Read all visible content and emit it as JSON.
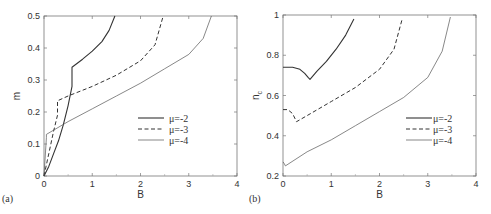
{
  "chart_data": [
    {
      "type": "line",
      "panel_label": "(a)",
      "title": "",
      "xlabel": "B",
      "ylabel": "m",
      "xlim": [
        0,
        4
      ],
      "ylim": [
        0,
        0.5
      ],
      "xticks": [
        "0",
        "1",
        "2",
        "3",
        "4"
      ],
      "yticks": [
        "0",
        "0.1",
        "0.2",
        "0.3",
        "0.4",
        "0.5"
      ],
      "grid": false,
      "legend_position": "lower right (inside)",
      "series": [
        {
          "name": "μ=-2",
          "style": "solid",
          "x": [
            0,
            0.1,
            0.2,
            0.3,
            0.4,
            0.5,
            0.58,
            0.58,
            0.8,
            1.0,
            1.2,
            1.35,
            1.47
          ],
          "y": [
            0,
            0.03,
            0.07,
            0.11,
            0.16,
            0.22,
            0.28,
            0.34,
            0.365,
            0.39,
            0.42,
            0.455,
            0.5
          ]
        },
        {
          "name": "μ=-3",
          "style": "dashed",
          "x": [
            0,
            0.1,
            0.2,
            0.28,
            0.28,
            0.5,
            1.0,
            1.5,
            2.0,
            2.3,
            2.47
          ],
          "y": [
            0,
            0.07,
            0.14,
            0.19,
            0.235,
            0.25,
            0.28,
            0.315,
            0.36,
            0.41,
            0.5
          ]
        },
        {
          "name": "μ=-4",
          "style": "thin solid",
          "x": [
            0,
            0.05,
            0.05,
            0.5,
            1.0,
            1.5,
            2.0,
            2.5,
            3.0,
            3.3,
            3.47
          ],
          "y": [
            0,
            0.12,
            0.13,
            0.17,
            0.21,
            0.25,
            0.29,
            0.335,
            0.38,
            0.43,
            0.5
          ]
        }
      ]
    },
    {
      "type": "line",
      "panel_label": "(b)",
      "title": "",
      "xlabel": "B",
      "ylabel": "n_c",
      "xlim": [
        0,
        4
      ],
      "ylim": [
        0.2,
        1.0
      ],
      "xticks": [
        "0",
        "1",
        "2",
        "3",
        "4"
      ],
      "yticks": [
        "0.2",
        "0.4",
        "0.6",
        "0.8",
        "1"
      ],
      "grid": false,
      "legend_position": "lower right (inside)",
      "series": [
        {
          "name": "μ=-2",
          "style": "solid",
          "x": [
            0,
            0.2,
            0.35,
            0.45,
            0.52,
            0.56,
            0.7,
            0.9,
            1.1,
            1.3,
            1.47
          ],
          "y": [
            0.74,
            0.74,
            0.73,
            0.71,
            0.69,
            0.68,
            0.72,
            0.77,
            0.83,
            0.9,
            0.98
          ]
        },
        {
          "name": "μ=-3",
          "style": "dashed",
          "x": [
            0,
            0.1,
            0.2,
            0.28,
            0.5,
            1.0,
            1.5,
            2.0,
            2.3,
            2.47
          ],
          "y": [
            0.53,
            0.53,
            0.51,
            0.47,
            0.5,
            0.57,
            0.64,
            0.73,
            0.83,
            0.98
          ]
        },
        {
          "name": "μ=-4",
          "style": "thin solid",
          "x": [
            0,
            0.03,
            0.05,
            0.5,
            1.0,
            1.5,
            2.0,
            2.5,
            3.0,
            3.3,
            3.47
          ],
          "y": [
            0.27,
            0.26,
            0.25,
            0.32,
            0.38,
            0.45,
            0.52,
            0.59,
            0.69,
            0.82,
            0.99
          ]
        }
      ]
    }
  ],
  "legend": {
    "entries": [
      "μ=-2",
      "μ=-3",
      "μ=-4"
    ]
  }
}
